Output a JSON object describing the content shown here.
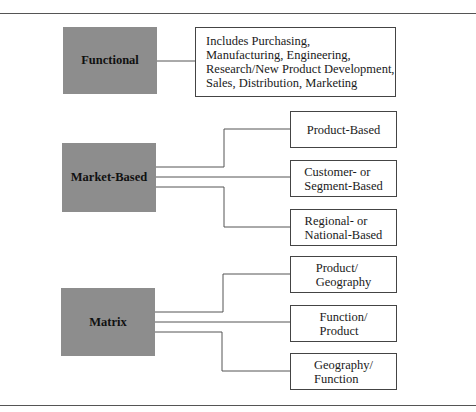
{
  "diagram": {
    "colors": {
      "category_fill": "#8d8d8d",
      "line": "#555555",
      "box_border": "#444444"
    },
    "groups": [
      {
        "name": "Functional",
        "children": [
          {
            "label": "Includes Purchasing,\nManufacturing, Engineering,\nResearch/New Product Development,\nSales, Distribution, Marketing"
          }
        ]
      },
      {
        "name": "Market-Based",
        "children": [
          {
            "label": "Product-Based"
          },
          {
            "label": "Customer- or\nSegment-Based"
          },
          {
            "label": "Regional- or\nNational-Based"
          }
        ]
      },
      {
        "name": "Matrix",
        "children": [
          {
            "label": "Product/\nGeography"
          },
          {
            "label": "Function/\nProduct"
          },
          {
            "label": "Geography/\nFunction"
          }
        ]
      }
    ]
  }
}
